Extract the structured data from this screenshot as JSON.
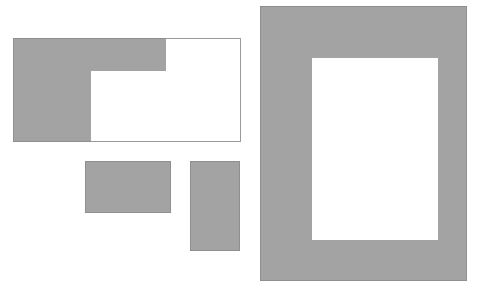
{
  "diagram": {
    "type": "rectangles",
    "colors": {
      "fill": "#a3a3a3",
      "stroke": "#8f8f8f",
      "background": "#ffffff"
    },
    "shapes": [
      {
        "id": "l-shape-frame",
        "kind": "outlined-rectangle-with-l-fill",
        "x": 13,
        "y": 38,
        "w": 228,
        "h": 104,
        "fill_parts": [
          {
            "x": 13,
            "y": 38,
            "w": 153,
            "h": 33
          },
          {
            "x": 13,
            "y": 71,
            "w": 78,
            "h": 71
          }
        ]
      },
      {
        "id": "small-rect-wide",
        "kind": "filled-rectangle",
        "x": 85,
        "y": 161,
        "w": 86,
        "h": 52
      },
      {
        "id": "small-rect-tall",
        "kind": "filled-rectangle",
        "x": 190,
        "y": 161,
        "w": 50,
        "h": 90
      },
      {
        "id": "frame-rect",
        "kind": "filled-frame",
        "x": 260,
        "y": 6,
        "w": 207,
        "h": 275,
        "hole": {
          "x": 312,
          "y": 58,
          "w": 126,
          "h": 182
        }
      }
    ]
  }
}
